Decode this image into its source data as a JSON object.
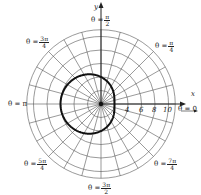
{
  "chart_data": {
    "type": "polar",
    "title": "",
    "equation_shape": "limacon r = 4 - 2cos(theta)",
    "series": [
      {
        "name": "curve",
        "points_r_theta": [
          {
            "theta": "0",
            "r": 2
          },
          {
            "theta": "pi/2",
            "r": 4
          },
          {
            "theta": "pi",
            "r": 6
          },
          {
            "theta": "3pi/2",
            "r": 4
          }
        ]
      }
    ],
    "radial_ticks": [
      "4",
      "6",
      "8",
      "10"
    ],
    "radial_grid": [
      2,
      4,
      6,
      8,
      10,
      11
    ],
    "angular_grid_step_deg": 15,
    "angle_labels": [
      {
        "id": "a0",
        "prefix": "θ = ",
        "value": "0"
      },
      {
        "id": "a1",
        "prefix": "θ = ",
        "num": "π",
        "den": "4"
      },
      {
        "id": "a2",
        "prefix": "θ = ",
        "num": "π",
        "den": "2"
      },
      {
        "id": "a3",
        "prefix": "θ = ",
        "num": "3π",
        "den": "4"
      },
      {
        "id": "a4",
        "prefix": "θ = ",
        "value": "π"
      },
      {
        "id": "a5",
        "prefix": "θ = ",
        "num": "5π",
        "den": "4"
      },
      {
        "id": "a6",
        "prefix": "θ = ",
        "num": "3π",
        "den": "2"
      },
      {
        "id": "a7",
        "prefix": "θ = ",
        "num": "7π",
        "den": "4"
      }
    ],
    "xlabel": "x",
    "ylabel": "y",
    "grid": true,
    "colors": {
      "grid": "#555555",
      "curve": "#111111",
      "axis": "#222222"
    }
  },
  "labels": {
    "x_axis": "x",
    "y_axis": "y",
    "theta_0": "θ = 0",
    "theta_pi": "θ = π",
    "prefix": "θ =",
    "pi": "π",
    "three_pi": "3π",
    "five_pi": "5π",
    "seven_pi": "7π",
    "two": "2",
    "four": "4",
    "tick_4": "4",
    "tick_6": "6",
    "tick_8": "8",
    "tick_10": "10"
  }
}
